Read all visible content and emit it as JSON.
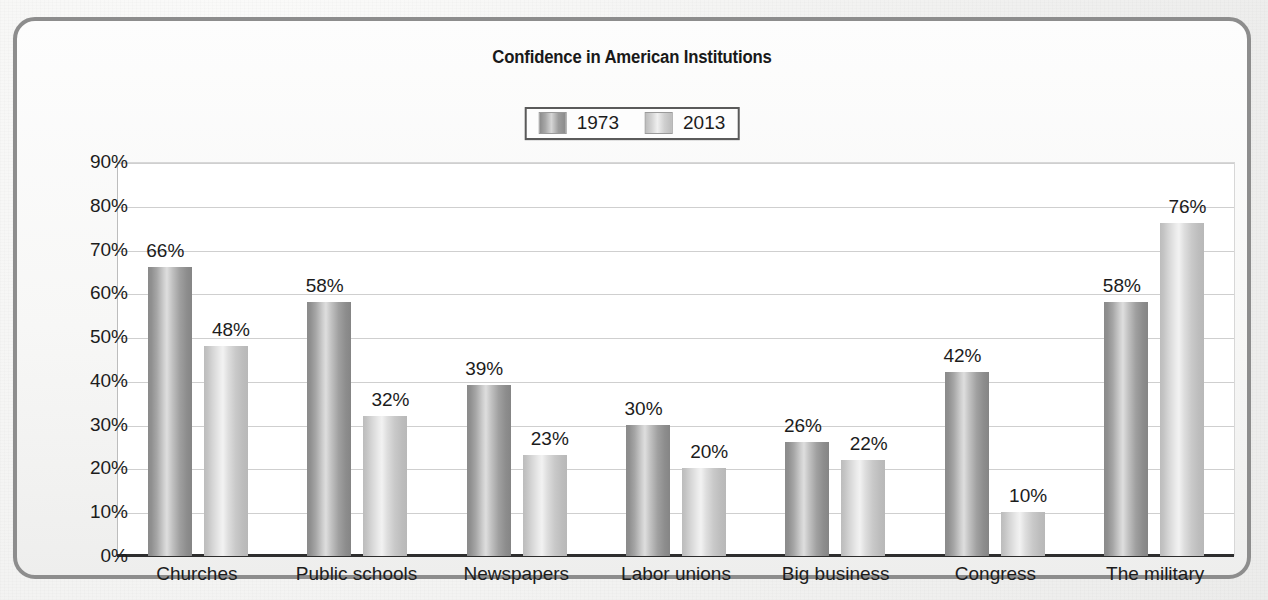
{
  "chart_data": {
    "type": "bar",
    "title": "Confidence in American Institutions",
    "xlabel": "",
    "ylabel": "",
    "ylim": [
      0,
      90
    ],
    "ytick_labels": [
      "90%",
      "80%",
      "70%",
      "60%",
      "50%",
      "40%",
      "30%",
      "20%",
      "10%",
      "0%"
    ],
    "ytick_values": [
      90,
      80,
      70,
      60,
      50,
      40,
      30,
      20,
      10,
      0
    ],
    "grid": true,
    "legend_position": "top-center",
    "categories": [
      "Churches",
      "Public schools",
      "Newspapers",
      "Labor unions",
      "Big business",
      "Congress",
      "The military"
    ],
    "series": [
      {
        "name": "1973",
        "color": "#9a9a9a",
        "values": [
          66,
          58,
          39,
          30,
          26,
          42,
          58
        ],
        "data_labels": [
          "66%",
          "58%",
          "39%",
          "30%",
          "26%",
          "42%",
          "58%"
        ]
      },
      {
        "name": "2013",
        "color": "#cfcfcf",
        "values": [
          48,
          32,
          23,
          20,
          22,
          10,
          76
        ],
        "data_labels": [
          "48%",
          "32%",
          "23%",
          "20%",
          "22%",
          "10%",
          "76%"
        ]
      }
    ]
  },
  "legend": {
    "items": [
      {
        "label": "1973",
        "swatch": "swatch-1973"
      },
      {
        "label": "2013",
        "swatch": "swatch-2013"
      }
    ]
  },
  "colors": {
    "frame_border": "#8d8d8d",
    "axis": "#2e2e2e",
    "gridline": "#cfcfcf",
    "text": "#1c1c1c",
    "plot_background": "#ffffff",
    "page_background": "#f3f3f2"
  }
}
